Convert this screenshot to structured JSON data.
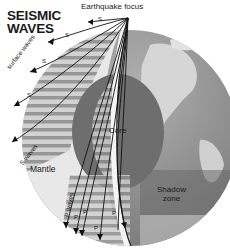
{
  "title": {
    "line1": "SEISMIC",
    "line2": "WAVES"
  },
  "labels": {
    "earthquake_focus": "Earthquake focus",
    "core": "Core",
    "mantle": "Mantle",
    "shadow_zone_line1": "Shadow",
    "shadow_zone_line2": "zone",
    "surface_waves": "surface waves",
    "s_waves": "S waves",
    "p_waves": "P waves"
  },
  "wave_markers": {
    "s": [
      "S",
      "S",
      "S",
      "S"
    ],
    "p": [
      "P",
      "P",
      "P",
      "P",
      "P"
    ]
  },
  "colors": {
    "ocean": "#8a8a8a",
    "land": "#d4d4d4",
    "mantle": "#e6e6e6",
    "core": "#6e6e6e",
    "shadow": "#7a7a7a",
    "lines": "#111111"
  }
}
